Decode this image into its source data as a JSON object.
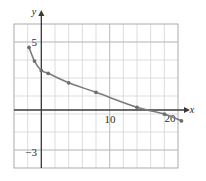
{
  "figure": {
    "kind": "coordinate-graph",
    "background_color": "#ffffff",
    "width": 206,
    "height": 181
  },
  "axes": {
    "x_axis_label": "x",
    "y_axis_label": "y",
    "axis_color": "#3a3a3a",
    "grid_color": "#cfcfcf",
    "grid_visible": true,
    "x_tick_labels": [
      "10",
      "20"
    ],
    "y_tick_labels": [
      "5",
      "−3"
    ]
  },
  "chart_data": {
    "type": "line",
    "title": "",
    "xlabel": "x",
    "ylabel": "y",
    "xlim": [
      -2,
      22
    ],
    "ylim": [
      -4,
      7
    ],
    "grid": true,
    "legend": "none",
    "series": [
      {
        "name": "curve",
        "color": "#7a7a7a",
        "marker": "circle",
        "marker_color": "#6e6e6e",
        "x": [
          -1.8,
          -1.0,
          0.0,
          1.0,
          4.0,
          8.0,
          14.0,
          18.0,
          20.5
        ],
        "y": [
          4.6,
          3.6,
          2.9,
          2.7,
          2.0,
          1.3,
          0.2,
          -0.3,
          -0.8
        ]
      }
    ],
    "x_ticks": [
      10,
      20
    ],
    "y_ticks": [
      5,
      -3
    ],
    "x_tick_labels": [
      "10",
      "20"
    ],
    "y_tick_labels": [
      "5",
      "-3"
    ]
  }
}
